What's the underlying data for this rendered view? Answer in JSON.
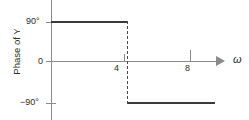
{
  "chart_data": {
    "type": "line",
    "title": "",
    "xlabel": "ω",
    "ylabel": "Phase of Y",
    "x_ticks": [
      4,
      8
    ],
    "x_tick_labels": [
      "4",
      "8"
    ],
    "y_ticks": [
      90,
      0,
      -90
    ],
    "y_tick_labels": [
      "90°",
      "0",
      "−90°"
    ],
    "xlim": [
      0,
      10
    ],
    "ylim": [
      -115,
      115
    ],
    "grid": false,
    "legend": null,
    "series": [
      {
        "name": "Phase of Y",
        "style": "step",
        "x": [
          0,
          4.4,
          4.4,
          9
        ],
        "values": [
          90,
          90,
          -90,
          -90
        ]
      }
    ],
    "annotations": [
      {
        "name": "phase-step-transition",
        "type": "vertical-dashed-line",
        "x": 4.4,
        "from_y": 90,
        "to_y": -90
      }
    ],
    "axis_arrow": "x-axis-right-arrow"
  },
  "labels": {
    "y_axis_title": "Phase of Y",
    "y_90": "90°",
    "y_0": "0",
    "y_minus_90": "−90°",
    "x_4": "4",
    "x_8": "8",
    "x_omega": "ω"
  },
  "colors": {
    "background": "#ffffff",
    "axis": "#8a8a8a",
    "trace": "#3a3a3a",
    "dashed": "#4a4a4a",
    "text": "#2b2b2b"
  }
}
